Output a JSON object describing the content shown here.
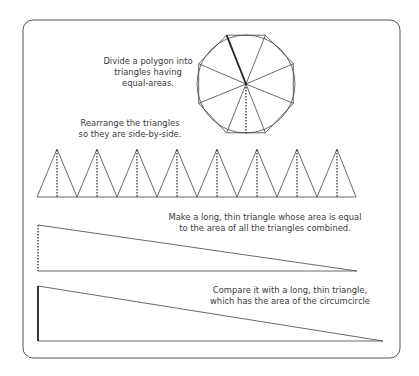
{
  "labels": {
    "step1": "Divide a polygon into\ntriangles having\nequal-areas.",
    "step2": "Rearrange the triangles\nso they are side-by-side.",
    "step3": "Make a long, thin triangle whose area is equal\nto the area of all the triangles combined.",
    "step4": "Compare it with a long, thin triangle,\nwhich has the area of the circumcircle"
  },
  "colors": {
    "stroke": "#3c3c3c",
    "frame": "#555555",
    "text": "#3a3a3a",
    "background": "#ffffff"
  },
  "geometry": {
    "polygon_sides": 8,
    "triangles_in_row": 8
  }
}
